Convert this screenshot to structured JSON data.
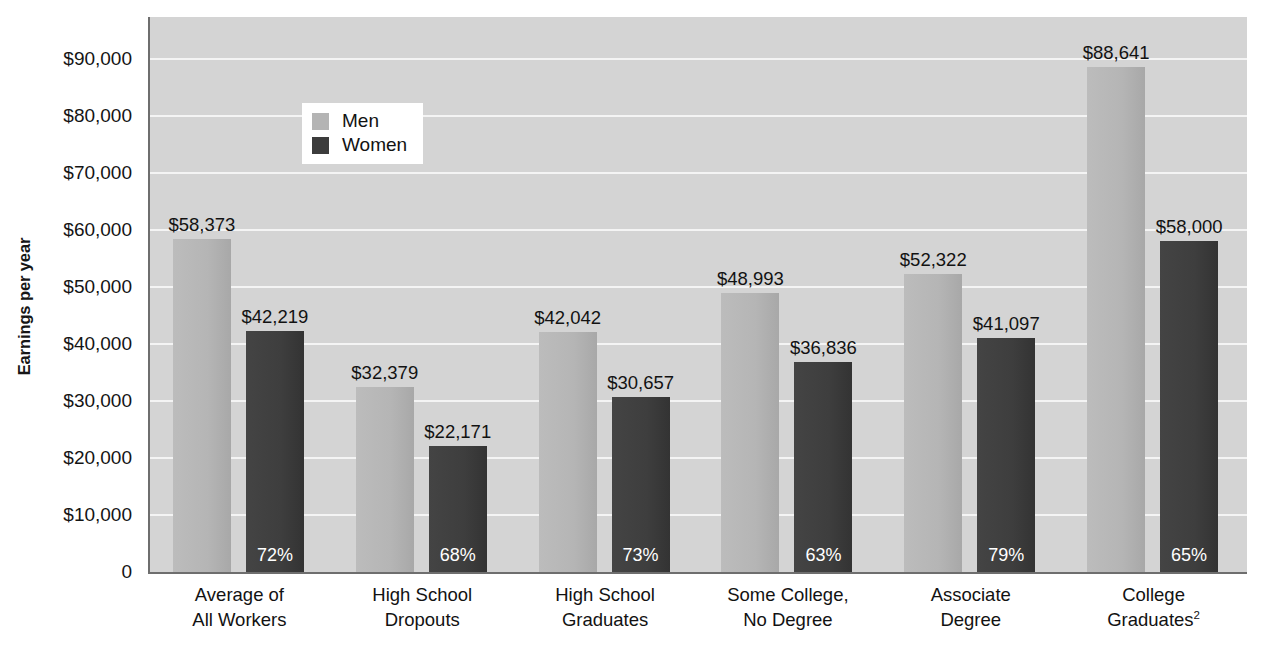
{
  "chart_data": {
    "type": "bar",
    "title": "",
    "xlabel": "",
    "ylabel": "Earnings per year",
    "ylim": [
      0,
      95000
    ],
    "grid": true,
    "legend_position": "upper-left-inside",
    "categories": [
      "Average of All Workers",
      "High School Dropouts",
      "High School Graduates",
      "Some College, No Degree",
      "Associate Degree",
      "College Graduates"
    ],
    "series": [
      {
        "name": "Men",
        "color": "#b4b4b4",
        "values": [
          58373,
          32379,
          42042,
          48993,
          52322,
          88641
        ],
        "labels": [
          "$58,373",
          "$32,379",
          "$42,042",
          "$48,993",
          "$52,322",
          "$88,641"
        ]
      },
      {
        "name": "Women",
        "color": "#3c3c3c",
        "values": [
          42219,
          22171,
          30657,
          36836,
          41097,
          58000
        ],
        "labels": [
          "$42,219",
          "$22,171",
          "$30,657",
          "$36,836",
          "$41,097",
          "$58,000"
        ]
      }
    ],
    "ratio_labels": [
      "72%",
      "68%",
      "73%",
      "63%",
      "79%",
      "65%"
    ],
    "ytick_values": [
      0,
      10000,
      20000,
      30000,
      40000,
      50000,
      60000,
      70000,
      80000,
      90000
    ],
    "ytick_labels": [
      "0",
      "$10,000",
      "$20,000",
      "$30,000",
      "$40,000",
      "$50,000",
      "$60,000",
      "$70,000",
      "$80,000",
      "$90,000"
    ]
  },
  "axis": {
    "y_title": "Earnings per year"
  },
  "legend": {
    "items": [
      {
        "label": "Men",
        "swatch": "men"
      },
      {
        "label": "Women",
        "swatch": "women"
      }
    ]
  },
  "x_labels": [
    {
      "line1": "Average of",
      "line2": "All Workers",
      "sup": ""
    },
    {
      "line1": "High School",
      "line2": "Dropouts",
      "sup": ""
    },
    {
      "line1": "High School",
      "line2": "Graduates",
      "sup": ""
    },
    {
      "line1": "Some College,",
      "line2": "No Degree",
      "sup": ""
    },
    {
      "line1": "Associate",
      "line2": "Degree",
      "sup": ""
    },
    {
      "line1": "College",
      "line2": "Graduates",
      "sup": "2"
    }
  ],
  "colors": {
    "plot_background": "#d4d4d4",
    "gridline": "#f4f4f4",
    "axis_line": "#6e6e6e",
    "men_bar": "#b4b4b4",
    "women_bar": "#3c3c3c",
    "text": "#121212"
  }
}
